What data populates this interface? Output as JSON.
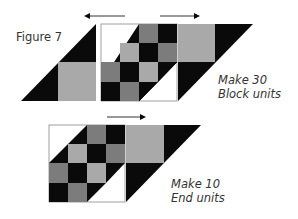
{
  "figure": {
    "title": "Figure 7",
    "colors": {
      "black": "#0a0a0a",
      "mid_gray": "#7c7c7c",
      "light_gray": "#a9a9a9",
      "white": "#ffffff",
      "outline": "#a0a0a0",
      "arrow": "#333333"
    },
    "top_unit": {
      "caption_line1": "Make 30",
      "caption_line2": "Block units",
      "arrows": [
        {
          "direction": "left"
        },
        {
          "direction": "right"
        }
      ]
    },
    "bottom_unit": {
      "caption_line1": "Make 10",
      "caption_line2": "End units",
      "arrows": [
        {
          "direction": "right"
        }
      ]
    },
    "checker_pattern": [
      [
        "white",
        "split-white-black",
        "mid_gray",
        "black"
      ],
      [
        "split-white-black",
        "light_gray",
        "black",
        "mid_gray"
      ],
      [
        "mid_gray",
        "black",
        "light_gray",
        "split-black-white"
      ],
      [
        "black",
        "mid_gray",
        "split-black-white",
        "white"
      ]
    ]
  }
}
